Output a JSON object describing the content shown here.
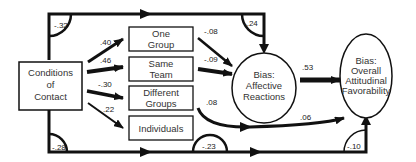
{
  "nodes": {
    "conditions": {
      "line1": "Conditions",
      "line2": "of",
      "line3": "Contact"
    },
    "one_group": {
      "line1": "One",
      "line2": "Group"
    },
    "same_team": {
      "line1": "Same",
      "line2": "Team"
    },
    "different_groups": {
      "line1": "Different",
      "line2": "Groups"
    },
    "individuals": {
      "line1": "Individuals"
    },
    "affective": {
      "line1": "Bias:",
      "line2": "Affective",
      "line3": "Reactions"
    },
    "overall": {
      "line1": "Bias:",
      "line2": "Overall",
      "line3": "Attitudinal",
      "line4": "Favorability"
    }
  },
  "paths": {
    "conditions_to_affective": "-.32",
    "top_to_affective": "-.24",
    "conditions_to_one_group": ".40",
    "conditions_to_same_team": ".46",
    "conditions_to_different_groups": "-.30",
    "conditions_to_individuals": ".22",
    "one_group_to_affective": "-.08",
    "same_team_to_affective": "-.09",
    "different_groups_to_overall": ".08",
    "affective_to_overall": ".53",
    "individuals_to_overall": ".06",
    "conditions_bottom": "-.28",
    "bottom_mid": "-.23",
    "bottom_to_overall": "-.10"
  },
  "colors": {
    "ink": "#111111",
    "background": "#ffffff"
  }
}
